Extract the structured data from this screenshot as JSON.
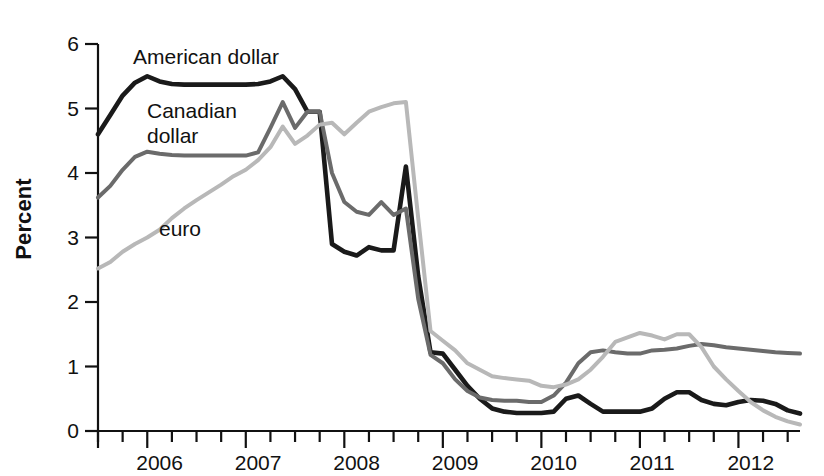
{
  "chart_data": {
    "type": "line",
    "title": "",
    "xlabel": "",
    "ylabel": "Percent",
    "ylim": [
      0,
      6
    ],
    "yticks": [
      0,
      1,
      2,
      3,
      4,
      5,
      6
    ],
    "ytick_labels": [
      "0",
      "1",
      "2",
      "3",
      "4",
      "5",
      "6"
    ],
    "xlim": [
      2005.5,
      2012.625
    ],
    "xtick_labels": [
      "2006",
      "2007",
      "2008",
      "2009",
      "2010",
      "2011",
      "2012"
    ],
    "xtick_values": [
      2006,
      2007,
      2008,
      2009,
      2010,
      2011,
      2012
    ],
    "minor_tick_interval_years": 0.25,
    "grid": false,
    "legend": "inline-annotations",
    "series": [
      {
        "name": "American dollar",
        "color": "#1a1a1a",
        "label_position": "top-left",
        "x": [
          2005.5,
          2005.625,
          2005.75,
          2005.875,
          2006.0,
          2006.125,
          2006.25,
          2006.375,
          2006.5,
          2006.625,
          2006.75,
          2006.875,
          2007.0,
          2007.125,
          2007.25,
          2007.375,
          2007.5,
          2007.625,
          2007.75,
          2007.875,
          2008.0,
          2008.125,
          2008.25,
          2008.375,
          2008.5,
          2008.625,
          2008.75,
          2008.875,
          2009.0,
          2009.125,
          2009.25,
          2009.375,
          2009.5,
          2009.625,
          2009.75,
          2009.875,
          2010.0,
          2010.125,
          2010.25,
          2010.375,
          2010.5,
          2010.625,
          2010.75,
          2010.875,
          2011.0,
          2011.125,
          2011.25,
          2011.375,
          2011.5,
          2011.625,
          2011.75,
          2011.875,
          2012.0,
          2012.125,
          2012.25,
          2012.375,
          2012.5,
          2012.625
        ],
        "y": [
          4.6,
          4.9,
          5.2,
          5.4,
          5.5,
          5.42,
          5.38,
          5.37,
          5.37,
          5.37,
          5.37,
          5.37,
          5.37,
          5.38,
          5.42,
          5.5,
          5.3,
          4.95,
          4.95,
          2.9,
          2.78,
          2.72,
          2.85,
          2.8,
          2.8,
          4.1,
          2.4,
          1.22,
          1.2,
          0.95,
          0.7,
          0.5,
          0.35,
          0.3,
          0.28,
          0.28,
          0.28,
          0.3,
          0.5,
          0.55,
          0.42,
          0.3,
          0.3,
          0.3,
          0.3,
          0.35,
          0.5,
          0.6,
          0.6,
          0.48,
          0.42,
          0.4,
          0.45,
          0.48,
          0.47,
          0.42,
          0.32,
          0.27
        ]
      },
      {
        "name": "Canadian dollar",
        "color": "#6b6b6b",
        "label_position": "upper-left",
        "x": [
          2005.5,
          2005.625,
          2005.75,
          2005.875,
          2006.0,
          2006.125,
          2006.25,
          2006.375,
          2006.5,
          2006.625,
          2006.75,
          2006.875,
          2007.0,
          2007.125,
          2007.25,
          2007.375,
          2007.5,
          2007.625,
          2007.75,
          2007.875,
          2008.0,
          2008.125,
          2008.25,
          2008.375,
          2008.5,
          2008.625,
          2008.75,
          2008.875,
          2009.0,
          2009.125,
          2009.25,
          2009.375,
          2009.5,
          2009.625,
          2009.75,
          2009.875,
          2010.0,
          2010.125,
          2010.25,
          2010.375,
          2010.5,
          2010.625,
          2010.75,
          2010.875,
          2011.0,
          2011.125,
          2011.25,
          2011.375,
          2011.5,
          2011.625,
          2011.75,
          2011.875,
          2012.0,
          2012.125,
          2012.25,
          2012.375,
          2012.5,
          2012.625
        ],
        "y": [
          3.62,
          3.8,
          4.05,
          4.25,
          4.33,
          4.3,
          4.28,
          4.27,
          4.27,
          4.27,
          4.27,
          4.27,
          4.27,
          4.32,
          4.7,
          5.1,
          4.7,
          4.95,
          4.95,
          4.0,
          3.55,
          3.4,
          3.35,
          3.55,
          3.35,
          3.45,
          2.05,
          1.18,
          1.05,
          0.8,
          0.62,
          0.52,
          0.48,
          0.47,
          0.47,
          0.45,
          0.45,
          0.55,
          0.75,
          1.05,
          1.22,
          1.25,
          1.22,
          1.2,
          1.2,
          1.25,
          1.26,
          1.28,
          1.32,
          1.35,
          1.33,
          1.3,
          1.28,
          1.26,
          1.24,
          1.22,
          1.21,
          1.2
        ]
      },
      {
        "name": "euro",
        "color": "#b8b8b8",
        "label_position": "center-left",
        "x": [
          2005.5,
          2005.625,
          2005.75,
          2005.875,
          2006.0,
          2006.125,
          2006.25,
          2006.375,
          2006.5,
          2006.625,
          2006.75,
          2006.875,
          2007.0,
          2007.125,
          2007.25,
          2007.375,
          2007.5,
          2007.625,
          2007.75,
          2007.875,
          2008.0,
          2008.125,
          2008.25,
          2008.375,
          2008.5,
          2008.625,
          2008.75,
          2008.875,
          2009.0,
          2009.125,
          2009.25,
          2009.375,
          2009.5,
          2009.625,
          2009.75,
          2009.875,
          2010.0,
          2010.125,
          2010.25,
          2010.375,
          2010.5,
          2010.625,
          2010.75,
          2010.875,
          2011.0,
          2011.125,
          2011.25,
          2011.375,
          2011.5,
          2011.625,
          2011.75,
          2011.875,
          2012.0,
          2012.125,
          2012.25,
          2012.375,
          2012.5,
          2012.625
        ],
        "y": [
          2.52,
          2.62,
          2.78,
          2.9,
          3.0,
          3.12,
          3.3,
          3.45,
          3.58,
          3.7,
          3.82,
          3.95,
          4.05,
          4.2,
          4.4,
          4.72,
          4.45,
          4.58,
          4.75,
          4.78,
          4.6,
          4.78,
          4.95,
          5.02,
          5.08,
          5.1,
          3.3,
          1.55,
          1.4,
          1.25,
          1.05,
          0.95,
          0.85,
          0.82,
          0.8,
          0.78,
          0.7,
          0.68,
          0.72,
          0.8,
          0.95,
          1.15,
          1.38,
          1.45,
          1.52,
          1.48,
          1.42,
          1.5,
          1.5,
          1.3,
          1.0,
          0.8,
          0.62,
          0.45,
          0.32,
          0.22,
          0.15,
          0.1
        ]
      }
    ]
  },
  "axis": {
    "ylabel": "Percent",
    "ytick_labels": [
      "0",
      "1",
      "2",
      "3",
      "4",
      "5",
      "6"
    ],
    "xtick_labels": [
      "2006",
      "2007",
      "2008",
      "2009",
      "2010",
      "2011",
      "2012"
    ]
  },
  "annotations": {
    "usd": "American dollar",
    "cad_line1": "Canadian",
    "cad_line2": "dollar",
    "eur": "euro"
  }
}
